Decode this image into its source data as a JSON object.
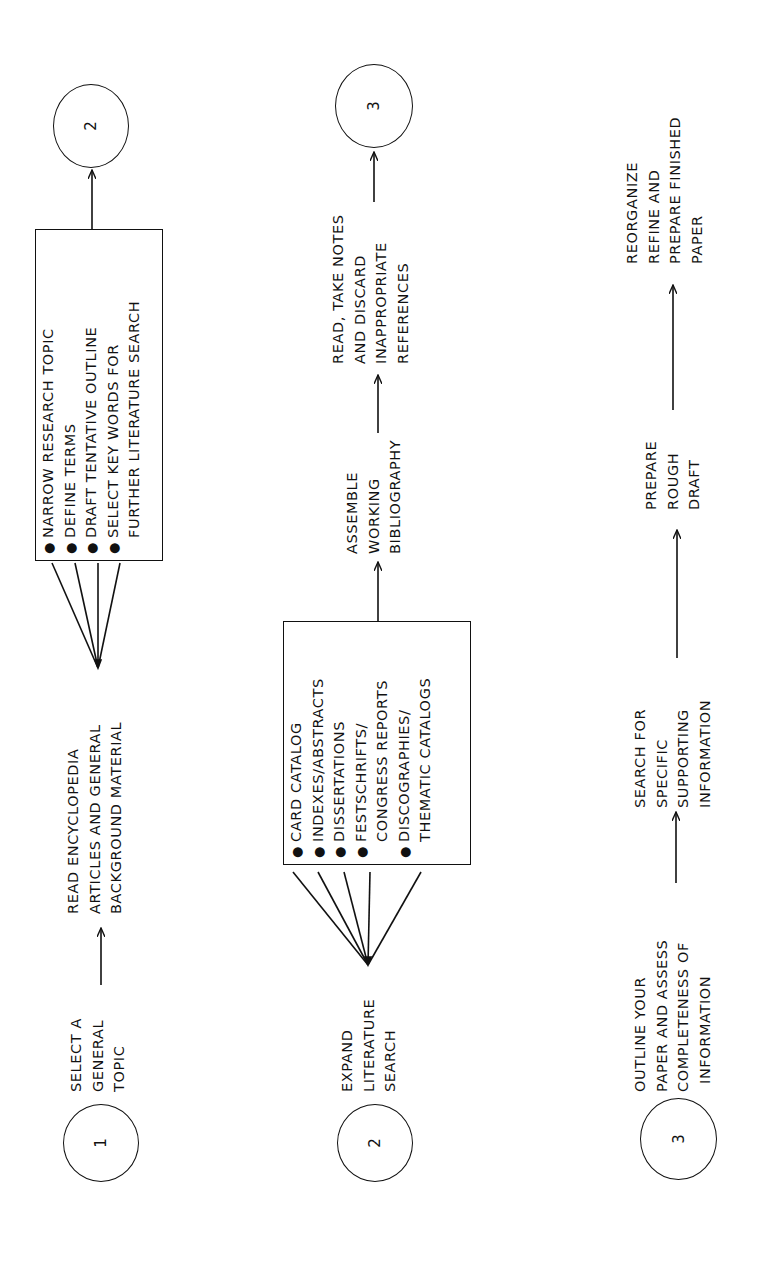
{
  "diagram": {
    "type": "flowchart",
    "orientation": "rotated-90-ccw",
    "rows": [
      {
        "start_node": "1",
        "steps": [
          {
            "lines": [
              "SELECT A",
              "GENERAL",
              "TOPIC"
            ]
          },
          {
            "lines": [
              "READ ENCYCLOPEDIA",
              "ARTICLES AND GENERAL",
              "BACKGROUND MATERIAL"
            ]
          }
        ],
        "box_items": [
          "NARROW RESEARCH TOPIC",
          "DEFINE TERMS",
          "DRAFT TENTATIVE OUTLINE",
          "SELECT KEY WORDS FOR\nFURTHER LITERATURE SEARCH"
        ],
        "box_lines": [
          {
            "bullet": "●",
            "text": "NARROW RESEARCH TOPIC"
          },
          {
            "bullet": "●",
            "text": "DEFINE TERMS"
          },
          {
            "bullet": "●",
            "text": "DRAFT TENTATIVE OUTLINE"
          },
          {
            "bullet": "●",
            "text": "SELECT KEY WORDS FOR"
          },
          {
            "bullet": "",
            "text": "FURTHER LITERATURE SEARCH"
          }
        ],
        "end_node": "2"
      },
      {
        "start_node": "2",
        "steps": [
          {
            "lines": [
              "EXPAND",
              "LITERATURE",
              "SEARCH"
            ]
          },
          {
            "lines": [
              "ASSEMBLE",
              "WORKING",
              "BIBLIOGRAPHY"
            ]
          },
          {
            "lines": [
              "READ, TAKE NOTES",
              "AND DISCARD",
              "INAPPROPRIATE",
              "REFERENCES"
            ]
          }
        ],
        "box_lines": [
          {
            "bullet": "●",
            "text": "CARD CATALOG"
          },
          {
            "bullet": "●",
            "text": "INDEXES/ABSTRACTS"
          },
          {
            "bullet": "●",
            "text": "DISSERTATIONS"
          },
          {
            "bullet": "●",
            "text": "FESTSCHRIFTS/"
          },
          {
            "bullet": "",
            "text": "CONGRESS REPORTS"
          },
          {
            "bullet": "●",
            "text": "DISCOGRAPHIES/"
          },
          {
            "bullet": "",
            "text": "THEMATIC CATALOGS"
          }
        ],
        "end_node": "3"
      },
      {
        "start_node": "3",
        "steps": [
          {
            "lines": [
              "OUTLINE YOUR",
              "PAPER AND ASSESS",
              "COMPLETENESS OF",
              "INFORMATION"
            ]
          },
          {
            "lines": [
              "SEARCH FOR",
              "SPECIFIC",
              "SUPPORTING",
              "INFORMATION"
            ]
          },
          {
            "lines": [
              "PREPARE",
              "ROUGH",
              "DRAFT"
            ]
          },
          {
            "lines": [
              "REORGANIZE",
              "REFINE AND",
              "PREPARE FINISHED",
              "PAPER"
            ]
          }
        ]
      }
    ]
  },
  "colors": {
    "ink": "#111111",
    "paper": "#ffffff"
  }
}
